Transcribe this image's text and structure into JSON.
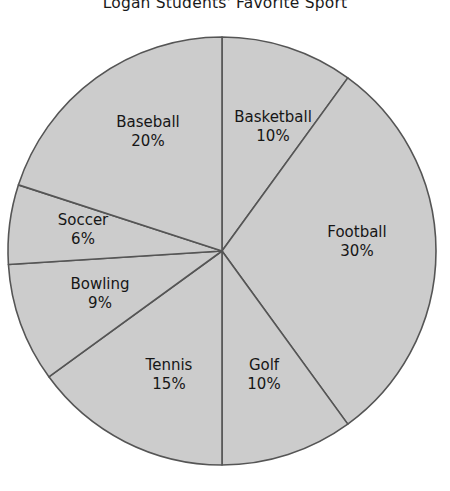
{
  "chart_data": {
    "type": "pie",
    "title": "Logan Students' Favorite Sport",
    "xlabel": "",
    "ylabel": "",
    "legend": "none",
    "grid": false,
    "units": "percent",
    "total": 100,
    "categories": [
      "Basketball",
      "Football",
      "Golf",
      "Tennis",
      "Bowling",
      "Soccer",
      "Baseball"
    ],
    "values": [
      10,
      30,
      10,
      15,
      9,
      6,
      20
    ],
    "slices": [
      {
        "label": "Basketball",
        "value": 10,
        "value_text": "10%",
        "start_angle": 0,
        "end_angle": 36,
        "label_x": 273,
        "label_y": 118
      },
      {
        "label": "Football",
        "value": 30,
        "value_text": "30%",
        "start_angle": 36,
        "end_angle": 144,
        "label_x": 357,
        "label_y": 233
      },
      {
        "label": "Golf",
        "value": 10,
        "value_text": "10%",
        "start_angle": 144,
        "end_angle": 180,
        "label_x": 264,
        "label_y": 366
      },
      {
        "label": "Tennis",
        "value": 15,
        "value_text": "15%",
        "start_angle": 180,
        "end_angle": 234,
        "label_x": 169,
        "label_y": 366
      },
      {
        "label": "Bowling",
        "value": 9,
        "value_text": "9%",
        "start_angle": 234,
        "end_angle": 266.4,
        "label_x": 100,
        "label_y": 285
      },
      {
        "label": "Soccer",
        "value": 6,
        "value_text": "6%",
        "start_angle": 266.4,
        "end_angle": 288,
        "label_x": 83,
        "label_y": 221
      },
      {
        "label": "Baseball",
        "value": 20,
        "value_text": "20%",
        "start_angle": 288,
        "end_angle": 360,
        "label_x": 148,
        "label_y": 123
      }
    ],
    "style": {
      "slice_fill": "#cccccc",
      "slice_stroke": "#555555",
      "stroke_width": 1.6,
      "background": "#ffffff",
      "text_color": "#161616"
    },
    "geometry": {
      "cx": 222,
      "cy": 251,
      "r": 214
    }
  }
}
